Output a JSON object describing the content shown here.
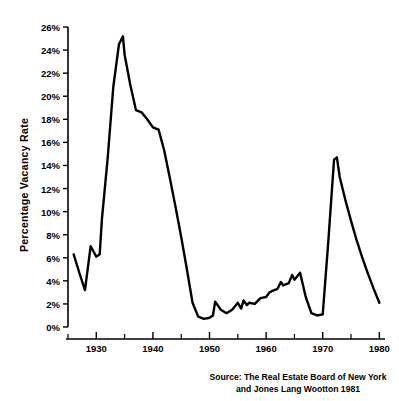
{
  "chart_data": {
    "type": "line",
    "title": "",
    "xlabel": "",
    "ylabel": "Percentage Vacancy Rate",
    "xlim": [
      1925,
      1981
    ],
    "ylim": [
      0,
      26
    ],
    "grid": false,
    "legend": null,
    "x_tick_labels": [
      "1930",
      "1940",
      "1950",
      "1960",
      "1970",
      "1980"
    ],
    "x_tick_values": [
      1930,
      1940,
      1950,
      1960,
      1970,
      1980
    ],
    "x_minor_tick_values": [
      1925,
      1935,
      1945,
      1955,
      1965,
      1975
    ],
    "y_tick_labels": [
      "0%",
      "2%",
      "4%",
      "6%",
      "8%",
      "10%",
      "12%",
      "14%",
      "16%",
      "18%",
      "20%",
      "22%",
      "24%",
      "26%"
    ],
    "y_tick_values": [
      0,
      2,
      4,
      6,
      8,
      10,
      12,
      14,
      16,
      18,
      20,
      22,
      24,
      26
    ],
    "series": [
      {
        "name": "Percentage Vacancy Rate",
        "color": "#000000",
        "x": [
          1926,
          1927,
          1928,
          1929,
          1930,
          1930.6,
          1931,
          1932,
          1933,
          1934,
          1934.7,
          1935,
          1936,
          1937,
          1938,
          1939,
          1940,
          1941,
          1942,
          1943,
          1944,
          1945,
          1946,
          1947,
          1948,
          1949,
          1950,
          1950.6,
          1951,
          1952,
          1953,
          1954,
          1955,
          1955.6,
          1956,
          1956.6,
          1957,
          1958,
          1959,
          1960,
          1960.6,
          1961,
          1962,
          1962.6,
          1963,
          1964,
          1964.6,
          1965,
          1966,
          1967,
          1968,
          1969,
          1970,
          1971,
          1972,
          1972.5,
          1973,
          1974,
          1975,
          1976,
          1977,
          1978,
          1979,
          1980
        ],
        "y": [
          6.3,
          4.7,
          3.2,
          7.0,
          6.1,
          6.3,
          9.4,
          14.6,
          20.8,
          24.5,
          25.2,
          23.6,
          21.0,
          18.8,
          18.6,
          18.0,
          17.3,
          17.1,
          15.3,
          12.9,
          10.4,
          7.8,
          5.0,
          2.1,
          0.9,
          0.7,
          0.8,
          1.0,
          2.2,
          1.5,
          1.2,
          1.5,
          2.1,
          1.6,
          2.3,
          1.9,
          2.1,
          2.0,
          2.5,
          2.6,
          3.0,
          3.1,
          3.3,
          3.9,
          3.6,
          3.8,
          4.5,
          4.1,
          4.7,
          2.6,
          1.2,
          1.0,
          1.1,
          7.5,
          14.5,
          14.7,
          13.0,
          11.0,
          9.2,
          7.5,
          6.0,
          4.6,
          3.3,
          2.1
        ]
      }
    ],
    "source_note_line1": "Source: The Real Estate Board of New York",
    "source_note_line2": "and Jones Lang Wootton 1981"
  },
  "axis": {
    "y_title": "Percentage Vacancy Rate"
  }
}
